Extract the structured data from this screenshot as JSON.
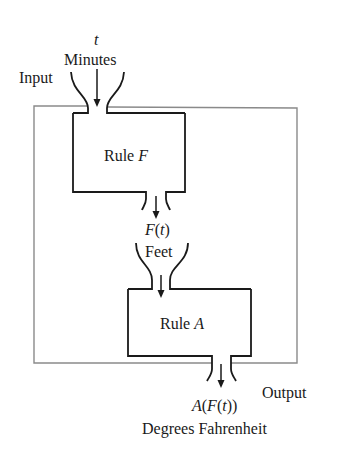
{
  "diagram": {
    "type": "function-composition-machine",
    "input": {
      "label": "Input",
      "variable": "t",
      "unit": "Minutes"
    },
    "stages": [
      {
        "name": "Rule",
        "symbol": "F",
        "output_expr": "F(t)",
        "output_unit": "Feet"
      },
      {
        "name": "Rule",
        "symbol": "A",
        "output_expr": "A(F(t))",
        "output_unit": "Degrees Fahrenheit"
      }
    ],
    "output": {
      "label": "Output"
    },
    "colors": {
      "ink": "#1a1a1a",
      "outer_frame": "#8a8a8a",
      "background": "#ffffff"
    }
  },
  "text": {
    "t": "t",
    "minutes": "Minutes",
    "input": "Input",
    "rule_f_word": "Rule ",
    "rule_f_sym": "F",
    "ft_f": "F",
    "ft_rest": "(t)",
    "feet": "Feet",
    "rule_a_word": "Rule ",
    "rule_a_sym": "A",
    "output": "Output",
    "aft_a": "A",
    "aft_p1": "(",
    "aft_f": "F",
    "aft_p2": "(",
    "aft_t": "t",
    "aft_p3": "))",
    "degrees": "Degrees Fahrenheit"
  }
}
